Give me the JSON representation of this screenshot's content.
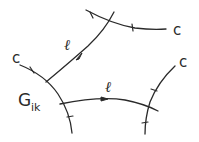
{
  "diagram": {
    "curves": [
      {
        "id": "c-left",
        "type": "c",
        "label": "c"
      },
      {
        "id": "l-upper",
        "type": "l",
        "label": "ℓ"
      },
      {
        "id": "c-top",
        "type": "c",
        "label": "c"
      },
      {
        "id": "l-lower",
        "type": "l",
        "label": "ℓ"
      },
      {
        "id": "c-right",
        "type": "c",
        "label": "c"
      }
    ],
    "region_label": {
      "main": "G",
      "subscript": "ik"
    },
    "stroke_color": "#2a2a2a",
    "background": "#ffffff"
  }
}
